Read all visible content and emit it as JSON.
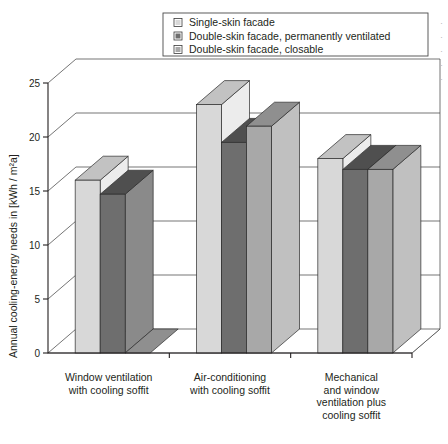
{
  "chart_data": {
    "type": "bar",
    "title": "",
    "xlabel": "",
    "ylabel": "Annual cooling-energy needs in [kWh / m²a]",
    "ylim": [
      0,
      25
    ],
    "yticks": [
      0,
      5,
      10,
      15,
      20,
      25
    ],
    "ytick_labels": [
      "0",
      "5",
      "10",
      "15",
      "20",
      "25"
    ],
    "grid": true,
    "legend_position": "top-center",
    "style": "3d-grouped-columns",
    "categories": [
      "Window ventilation with cooling soffit",
      "Air-conditioning with cooling soffit",
      "Mechanical and window ventilation plus cooling soffit"
    ],
    "category_lines": [
      [
        "Window ventilation",
        "with cooling soffit"
      ],
      [
        "Air-conditioning",
        "with cooling soffit"
      ],
      [
        "Mechanical",
        "and window",
        "ventilation plus",
        "cooling soffit"
      ]
    ],
    "series": [
      {
        "name": "Single-skin facade",
        "color": "#d8d8d8",
        "values": [
          16,
          23,
          18
        ]
      },
      {
        "name": "Double-skin facade, permanently ventilated",
        "color": "#6e6e6e",
        "values": [
          14.7,
          19.5,
          17
        ]
      },
      {
        "name": "Double-skin facade, closable",
        "color": "#a8a8a8",
        "values": [
          0,
          21,
          17
        ]
      }
    ]
  },
  "legend": {
    "items": [
      {
        "label": "Single-skin facade",
        "color": "#d8d8d8"
      },
      {
        "label": "Double-skin facade, permanently ventilated",
        "color": "#6e6e6e"
      },
      {
        "label": "Double-skin facade, closable",
        "color": "#a8a8a8"
      }
    ]
  },
  "axes": {
    "y_title": "Annual cooling-energy needs in [kWh / m²a]",
    "y_ticks": [
      "25",
      "20",
      "15",
      "10",
      "5",
      "0"
    ]
  },
  "colors": {
    "series_light": "#d8d8d8",
    "series_dark": "#6e6e6e",
    "series_medium": "#a8a8a8",
    "top_light": "#c2c2c2",
    "top_dark": "#4f4f4f",
    "top_medium": "#8f8f8f",
    "side_light": "#ececec",
    "side_dark": "#8a8a8a",
    "side_medium": "#c0c0c0",
    "line": "#231f20",
    "grid": "#3b3b3b",
    "background": "#ffffff"
  }
}
